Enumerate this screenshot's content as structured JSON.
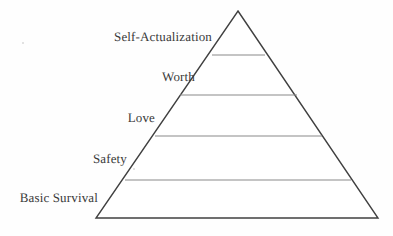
{
  "figure": {
    "background_color": "#fefefe",
    "outline_color": "#404040",
    "divider_color": "#8a8a8a",
    "text_color": "#3a3a3a"
  },
  "chart_data": {
    "type": "pyramid",
    "title": "",
    "subtitle": "",
    "xlabel": "",
    "ylabel": "",
    "grid": false,
    "legend": "none",
    "orientation": "apex-up",
    "apex": {
      "x": 238,
      "y": 11
    },
    "base_left": {
      "x": 96,
      "y": 218
    },
    "base_right": {
      "x": 378,
      "y": 218
    },
    "tier_count": 5,
    "categories": [
      "Self-Actualization",
      "Worth",
      "Love",
      "Safety",
      "Basic Survival"
    ],
    "tiers": [
      {
        "rank": 1,
        "label": "Self-Actualization",
        "position_from_top": 1,
        "top_y": 11,
        "bottom_y": 55,
        "left_x_at_bottom": 212,
        "right_x_at_bottom": 265,
        "label_baseline_y": 42
      },
      {
        "rank": 2,
        "label": "Worth",
        "position_from_top": 2,
        "top_y": 55,
        "bottom_y": 95,
        "left_x_at_bottom": 180,
        "right_x_at_bottom": 297,
        "label_baseline_y": 82
      },
      {
        "rank": 3,
        "label": "Love",
        "position_from_top": 3,
        "top_y": 95,
        "bottom_y": 136,
        "left_x_at_bottom": 155,
        "right_x_at_bottom": 322,
        "label_baseline_y": 123
      },
      {
        "rank": 4,
        "label": "Safety",
        "position_from_top": 4,
        "top_y": 136,
        "bottom_y": 180,
        "left_x_at_bottom": 125,
        "right_x_at_bottom": 351,
        "label_baseline_y": 164
      },
      {
        "rank": 5,
        "label": "Basic Survival",
        "position_from_top": 5,
        "top_y": 180,
        "bottom_y": 218,
        "left_x_at_bottom": 96,
        "right_x_at_bottom": 378,
        "label_baseline_y": 203
      }
    ],
    "dividers": [
      {
        "y": 55,
        "x1": 212,
        "x2": 265
      },
      {
        "y": 95,
        "x1": 180,
        "x2": 297
      },
      {
        "y": 136,
        "x1": 155,
        "x2": 322
      },
      {
        "y": 180,
        "x1": 125,
        "x2": 351
      }
    ]
  },
  "labels": {
    "self_actualization": "Self-Actualization",
    "worth": "Worth",
    "love": "Love",
    "safety": "Safety",
    "basic_survival": "Basic Survival"
  }
}
